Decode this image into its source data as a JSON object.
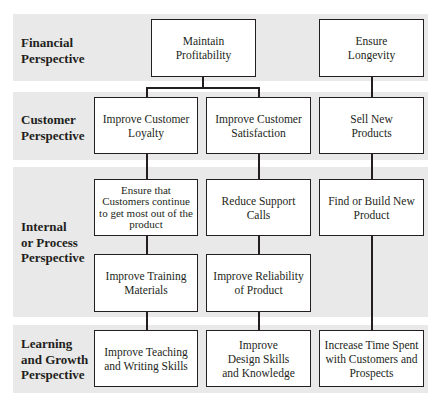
{
  "diagram": {
    "type": "strategy-map",
    "bands": [
      {
        "id": "financial",
        "label_line1": "Financial",
        "label_line2": "Perspective"
      },
      {
        "id": "customer",
        "label_line1": "Customer",
        "label_line2": "Perspective"
      },
      {
        "id": "internal",
        "label_line1": "Internal",
        "label_line2": "or Process",
        "label_line3": "Perspective"
      },
      {
        "id": "learning",
        "label_line1": "Learning",
        "label_line2": "and Growth",
        "label_line3": "Perspective"
      }
    ],
    "nodes": {
      "maintain_profitability": "Maintain Profitability",
      "ensure_longevity": "Ensure Longevity",
      "improve_customer_loyalty": "Improve Customer Loyalty",
      "improve_customer_satisfaction": "Improve Customer Satisfaction",
      "sell_new_products": "Sell New Products",
      "ensure_customers_continue": "Ensure that Customers continue to get most out of the product",
      "reduce_support_calls": "Reduce Support Calls",
      "find_or_build_new_product": "Find or Build New Product",
      "improve_training_materials": "Improve Training Materials",
      "improve_reliability_of_product": "Improve Reliability of Product",
      "improve_teaching_writing": "Improve Teaching and Writing Skills",
      "improve_design_skills": "Improve Design Skills and Knowledge",
      "increase_time_spent": "Increase Time Spent with Customers and Prospects"
    },
    "edges": [
      [
        "maintain_profitability",
        "improve_customer_loyalty"
      ],
      [
        "maintain_profitability",
        "improve_customer_satisfaction"
      ],
      [
        "ensure_longevity",
        "sell_new_products"
      ],
      [
        "improve_customer_loyalty",
        "ensure_customers_continue"
      ],
      [
        "improve_customer_satisfaction",
        "reduce_support_calls"
      ],
      [
        "sell_new_products",
        "find_or_build_new_product"
      ],
      [
        "ensure_customers_continue",
        "improve_training_materials"
      ],
      [
        "reduce_support_calls",
        "improve_reliability_of_product"
      ],
      [
        "find_or_build_new_product",
        "increase_time_spent"
      ],
      [
        "improve_training_materials",
        "improve_teaching_writing"
      ],
      [
        "improve_reliability_of_product",
        "improve_design_skills"
      ]
    ]
  }
}
